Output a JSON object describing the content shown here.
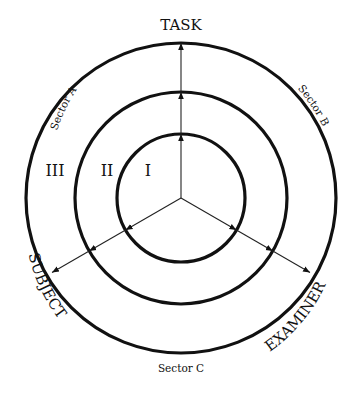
{
  "diagram": {
    "center": {
      "x": 181,
      "y": 198
    },
    "rings": [
      {
        "id": "I",
        "label": "I",
        "radius": 64
      },
      {
        "id": "II",
        "label": "II",
        "radius": 106
      },
      {
        "id": "III",
        "label": "III",
        "radius": 155
      }
    ],
    "axes": {
      "task": {
        "label": "TASK",
        "angle_deg": -90
      },
      "subject": {
        "label": "SUBJECT",
        "angle_deg": 150
      },
      "examiner": {
        "label": "EXAMINER",
        "angle_deg": 30
      }
    },
    "sectors": {
      "a": "Sector A",
      "b": "Sector B",
      "c": "Sector C"
    },
    "colors": {
      "line": "#111111",
      "background": "#ffffff"
    }
  }
}
